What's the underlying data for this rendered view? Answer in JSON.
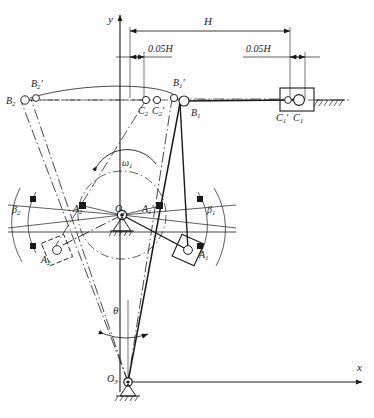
{
  "figure": {
    "type": "mechanism-kinematic-diagram",
    "background_color": "#ffffff",
    "line_color": "#1a1a1a",
    "axes": {
      "y_label": "y",
      "x_label": "x",
      "origin_label": "O",
      "origin_sub": "3"
    },
    "dimensions": [
      {
        "name": "stroke",
        "label": "H",
        "sub": ""
      },
      {
        "name": "left-offset",
        "label": "0.05H",
        "sub": ""
      },
      {
        "name": "right-offset",
        "label": "0.05H",
        "sub": ""
      }
    ],
    "angular": {
      "omega_label": "ω",
      "omega_sub": "1",
      "theta_label": "θ",
      "beta1_label": "β",
      "beta1_sub": "1",
      "beta2_label": "β",
      "beta2_sub": "2"
    },
    "points": [
      {
        "id": "B2p",
        "label": "B",
        "sub": "2",
        "prime": true,
        "x": 31,
        "y": 87
      },
      {
        "id": "B2",
        "label": "B",
        "sub": "2",
        "prime": false,
        "x": 14,
        "y": 101
      },
      {
        "id": "C2",
        "label": "C",
        "sub": "2",
        "prime": false,
        "x": 141,
        "y": 108
      },
      {
        "id": "C2p",
        "label": "C",
        "sub": "2",
        "prime": true,
        "x": 155,
        "y": 108
      },
      {
        "id": "B1p",
        "label": "B",
        "sub": "1",
        "prime": true,
        "x": 178,
        "y": 86
      },
      {
        "id": "B1",
        "label": "B",
        "sub": "1",
        "prime": false,
        "x": 196,
        "y": 113
      },
      {
        "id": "C1p",
        "label": "C",
        "sub": "1",
        "prime": true,
        "x": 287,
        "y": 114
      },
      {
        "id": "C1",
        "label": "C",
        "sub": "1",
        "prime": false,
        "x": 302,
        "y": 114
      },
      {
        "id": "O1",
        "label": "O",
        "sub": "1",
        "prime": false,
        "x": 122,
        "y": 215
      },
      {
        "id": "A2p",
        "label": "A",
        "sub": "2",
        "prime": true,
        "x": 78,
        "y": 212
      },
      {
        "id": "A1p",
        "label": "A",
        "sub": "1",
        "prime": true,
        "x": 147,
        "y": 212
      },
      {
        "id": "A2",
        "label": "A",
        "sub": "2",
        "prime": false,
        "x": 46,
        "y": 253
      },
      {
        "id": "A1",
        "label": "A",
        "sub": "1",
        "prime": false,
        "x": 176,
        "y": 253
      },
      {
        "id": "O3",
        "label": "O",
        "sub": "3",
        "prime": false,
        "x": 128,
        "y": 382
      }
    ]
  }
}
